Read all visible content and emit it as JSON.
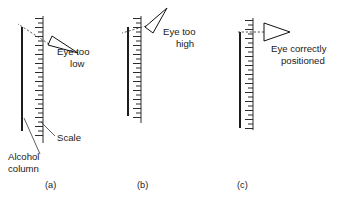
{
  "figure": {
    "title": "",
    "background_color": "#ffffff",
    "ink_color": "#111111"
  },
  "panels": [
    {
      "id": "a",
      "label": "(a)",
      "eye_state": "low",
      "caption_line1": "Eye too",
      "caption_line2": "low",
      "annotations": [
        {
          "name": "scale",
          "text": "Scale"
        },
        {
          "name": "alcohol-column",
          "text_line1": "Alcohol",
          "text_line2": "column"
        }
      ]
    },
    {
      "id": "b",
      "label": "(b)",
      "eye_state": "high",
      "caption_line1": "Eye too",
      "caption_line2": "high",
      "annotations": []
    },
    {
      "id": "c",
      "label": "(c)",
      "eye_state": "correct",
      "caption_line1": "Eye correctly",
      "caption_line2": "positioned",
      "annotations": []
    }
  ]
}
